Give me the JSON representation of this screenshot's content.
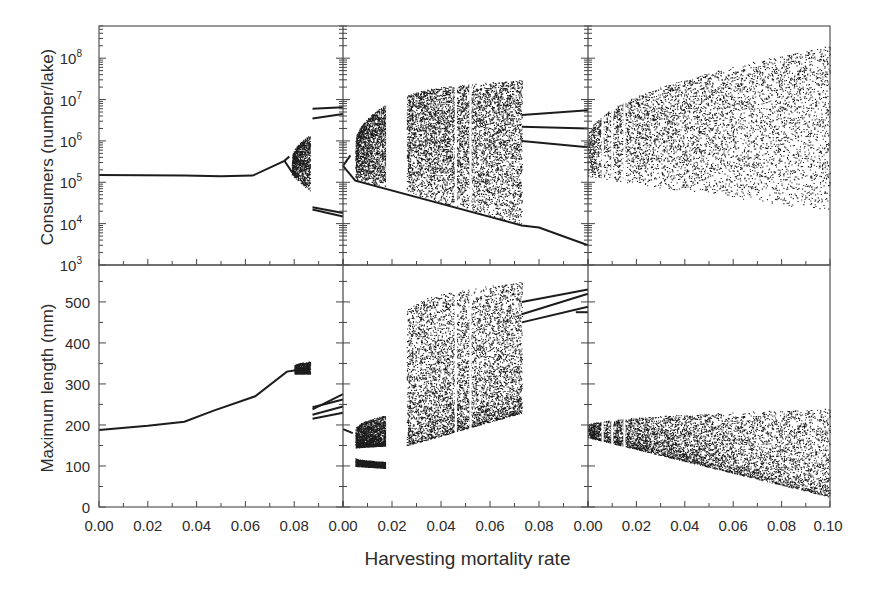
{
  "chart_data": {
    "type": "scatter",
    "title": "",
    "xlabel": "Harvesting mortality rate",
    "layout": {
      "rows": 2,
      "cols": 3,
      "grid": false,
      "legend": "none"
    },
    "rows": [
      {
        "ylabel": "Consumers (number/lake)",
        "yscale": "log",
        "ylim": [
          1000,
          600000000
        ],
        "yticks": [
          {
            "value": 1000,
            "label": "10",
            "exp": "3"
          },
          {
            "value": 10000,
            "label": "10",
            "exp": "4"
          },
          {
            "value": 100000,
            "label": "10",
            "exp": "5"
          },
          {
            "value": 1000000,
            "label": "10",
            "exp": "6"
          },
          {
            "value": 10000000,
            "label": "10",
            "exp": "7"
          },
          {
            "value": 100000000,
            "label": "10",
            "exp": "8"
          }
        ]
      },
      {
        "ylabel": "Maximum length (mm)",
        "yscale": "linear",
        "ylim": [
          0,
          590
        ],
        "yticks": [
          {
            "value": 0,
            "label": "0"
          },
          {
            "value": 100,
            "label": "100"
          },
          {
            "value": 200,
            "label": "200"
          },
          {
            "value": 300,
            "label": "300"
          },
          {
            "value": 400,
            "label": "400"
          },
          {
            "value": 500,
            "label": "500"
          }
        ]
      }
    ],
    "columns": [
      {
        "xlim": [
          0,
          0.1
        ],
        "xticks": [
          "0.00",
          "0.02",
          "0.04",
          "0.06",
          "0.08"
        ],
        "consumers": {
          "lines": [
            [
              [
                0,
                150000
              ],
              [
                0.035,
                145000
              ],
              [
                0.05,
                140000
              ],
              [
                0.063,
                145000
              ],
              [
                0.076,
                330000
              ],
              [
                0.078,
                420000
              ]
            ],
            [
              [
                0.076,
                330000
              ],
              [
                0.079,
                180000
              ],
              [
                0.082,
                130000
              ]
            ],
            [
              [
                0.0875,
                6000000
              ],
              [
                0.1,
                6500000
              ]
            ],
            [
              [
                0.0875,
                3500000
              ],
              [
                0.1,
                4500000
              ]
            ],
            [
              [
                0.0875,
                25000
              ],
              [
                0.1,
                18000
              ]
            ],
            [
              [
                0.0875,
                22000
              ],
              [
                0.1,
                15000
              ]
            ]
          ],
          "bands": [
            {
              "x": [
                0.079,
                0.0865
              ],
              "ylow": [
                150000,
                60000
              ],
              "yhigh": [
                380000,
                1400000
              ]
            }
          ]
        },
        "length": {
          "lines": [
            [
              [
                0,
                188
              ],
              [
                0.02,
                198
              ],
              [
                0.035,
                208
              ],
              [
                0.047,
                235
              ],
              [
                0.064,
                270
              ],
              [
                0.077,
                330
              ],
              [
                0.08,
                333
              ],
              [
                0.086,
                338
              ]
            ],
            [
              [
                0.0875,
                243
              ],
              [
                0.1,
                262
              ]
            ],
            [
              [
                0.0875,
                238
              ],
              [
                0.1,
                275
              ]
            ],
            [
              [
                0.0875,
                225
              ],
              [
                0.1,
                245
              ]
            ],
            [
              [
                0.0875,
                215
              ],
              [
                0.1,
                230
              ]
            ]
          ],
          "bands": [
            {
              "x": [
                0.08,
                0.0865
              ],
              "ylow": [
                325,
                325
              ],
              "yhigh": [
                345,
                355
              ]
            }
          ]
        }
      },
      {
        "xlim": [
          0,
          0.1
        ],
        "xticks": [
          "0.00",
          "0.02",
          "0.04",
          "0.06",
          "0.08"
        ],
        "consumers": {
          "lines": [
            [
              [
                0,
                250000
              ],
              [
                0.005,
                110000
              ],
              [
                0.073,
                9000
              ],
              [
                0.08,
                8000
              ],
              [
                0.1,
                3000
              ]
            ],
            [
              [
                0.073,
                4200000
              ],
              [
                0.1,
                5500000
              ]
            ],
            [
              [
                0.073,
                2200000
              ],
              [
                0.1,
                2000000
              ]
            ],
            [
              [
                0.073,
                1000000
              ],
              [
                0.1,
                700000
              ]
            ],
            [
              [
                0.0,
                250000
              ],
              [
                0.003,
                450000
              ]
            ]
          ],
          "bands": [
            {
              "x": [
                0.005,
                0.018
              ],
              "ylow": [
                110000,
                75000
              ],
              "yhigh": [
                900000,
                8000000
              ]
            },
            {
              "x": [
                0.026,
                0.073
              ],
              "ylow": [
                55000,
                9000
              ],
              "yhigh": [
                12000000,
                30000000
              ]
            }
          ],
          "gaps": [
            0.018,
            0.046,
            0.052
          ]
        },
        "length": {
          "lines": [
            [
              [
                0,
                190
              ],
              [
                0.004,
                180
              ]
            ],
            [
              [
                0.073,
                500
              ],
              [
                0.1,
                530
              ]
            ],
            [
              [
                0.073,
                470
              ],
              [
                0.1,
                520
              ]
            ],
            [
              [
                0.073,
                450
              ],
              [
                0.1,
                488
              ]
            ],
            [
              [
                0.095,
                475
              ],
              [
                0.1,
                475
              ]
            ]
          ],
          "bands": [
            {
              "x": [
                0.005,
                0.018
              ],
              "ylow": [
                145,
                150
              ],
              "yhigh": [
                190,
                225
              ]
            },
            {
              "x": [
                0.005,
                0.018
              ],
              "ylow": [
                100,
                95
              ],
              "yhigh": [
                120,
                110
              ]
            },
            {
              "x": [
                0.026,
                0.073
              ],
              "ylow": [
                150,
                230
              ],
              "yhigh": [
                480,
                550
              ]
            }
          ],
          "gaps": [
            0.018,
            0.046,
            0.052
          ]
        }
      },
      {
        "xlim": [
          0,
          0.1
        ],
        "xticks": [
          "0.00",
          "0.02",
          "0.04",
          "0.06",
          "0.08",
          "0.10"
        ],
        "consumers": {
          "lines": [],
          "bands": [
            {
              "x": [
                0.0,
                0.1
              ],
              "ylow": [
                130000,
                20000
              ],
              "yhigh": [
                1200000,
                200000000
              ]
            }
          ],
          "gaps": [
            0.006,
            0.01,
            0.015
          ]
        },
        "length": {
          "lines": [],
          "bands": [
            {
              "x": [
                0.0,
                0.1
              ],
              "ylow": [
                170,
                25
              ],
              "yhigh": [
                200,
                240
              ]
            }
          ],
          "gaps": [
            0.006,
            0.01,
            0.015
          ]
        }
      }
    ]
  },
  "labels": {
    "y_top": "Consumers (number/lake)",
    "y_bottom": "Maximum length (mm)",
    "x_title": "Harvesting mortality rate"
  }
}
